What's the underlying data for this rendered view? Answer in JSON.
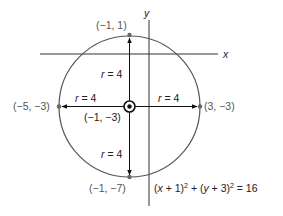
{
  "axes": {
    "x_label": "x",
    "y_label": "y"
  },
  "circle": {
    "center_label": "(−1, −3)",
    "radius_label": "r = 4",
    "equation": {
      "part1": "(",
      "x": "x",
      "part2": " + 1)",
      "sup1": "2",
      "part3": " + (",
      "y": "y",
      "part4": " + 3)",
      "sup2": "2",
      "part5": " = 16"
    },
    "points": {
      "top": "(−1, 1)",
      "bottom": "(−1, −7)",
      "left": "(−5, −3)",
      "right": "(3, −3)"
    },
    "radius_labels": {
      "up": "r = 4",
      "down": "r = 4",
      "left": "r = 4",
      "right": "r = 4"
    }
  },
  "colors": {
    "circle": "#555555",
    "axes": "#333333",
    "points": "#666666",
    "arrows": "#111111"
  }
}
